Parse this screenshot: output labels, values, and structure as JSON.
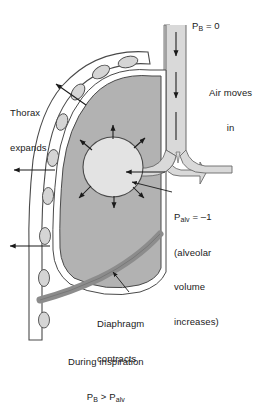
{
  "figure": {
    "background_color": "#ffffff"
  },
  "labels": {
    "pb": {
      "symbol": "P",
      "subscript": "B",
      "value": " = 0",
      "full_text": "PB = 0"
    },
    "air_moves": {
      "line1": "Air moves",
      "line2": "in"
    },
    "thorax": {
      "line1": "Thorax",
      "line2": "expands"
    },
    "palv": {
      "symbol": "P",
      "subscript": "alv",
      "value": " = –1",
      "line2": "(alveolar",
      "line3": "volume",
      "line4": "increases)",
      "full_text": "Palv = –1 (alveolar volume increases)"
    },
    "diaphragm": {
      "line1": "Diaphragm",
      "line2": "contracts"
    },
    "caption": {
      "line1": "During inspiration",
      "line2_symbol_a": "P",
      "line2_sub_a": "B",
      "line2_operator": " > ",
      "line2_symbol_b": "P",
      "line2_sub_b": "alv",
      "full_text": "During inspiration PB > Palv"
    }
  },
  "structures": {
    "trachea": {
      "name": "trachea",
      "fill": "#d9d9d9",
      "stroke": "#5a5a5a",
      "airflow_direction": "down"
    },
    "bronchus": {
      "name": "bronchus",
      "fill": "#d9d9d9",
      "stroke": "#5a5a5a",
      "airflow_direction": "left"
    },
    "lung": {
      "name": "lung",
      "fill": "#b2b2b2",
      "stroke": "#4a4a4a"
    },
    "pleura": {
      "name": "pleural-space",
      "fill": "#ffffff",
      "stroke": "#4a4a4a"
    },
    "alveolus": {
      "name": "alveolus",
      "fill": "#e3e3e3",
      "stroke": "#4a4a4a",
      "expansion_arrows": 6
    },
    "rib_cage": {
      "name": "rib-cage",
      "fill": "#ffffff",
      "stroke": "#4a4a4a",
      "rib_count": 8,
      "rib_fill": "#d5d5d5"
    },
    "diaphragm": {
      "name": "diaphragm",
      "fill": "#8c8c8c",
      "stroke": "#6a6a6a"
    }
  },
  "arrows": {
    "trachea_airflow_count": 3,
    "bronchus_airflow_count": 1,
    "thorax_expansion_count": 3,
    "alveolar_expansion_count": 6,
    "pointer_count": 2,
    "color": "#1a1a1a"
  }
}
